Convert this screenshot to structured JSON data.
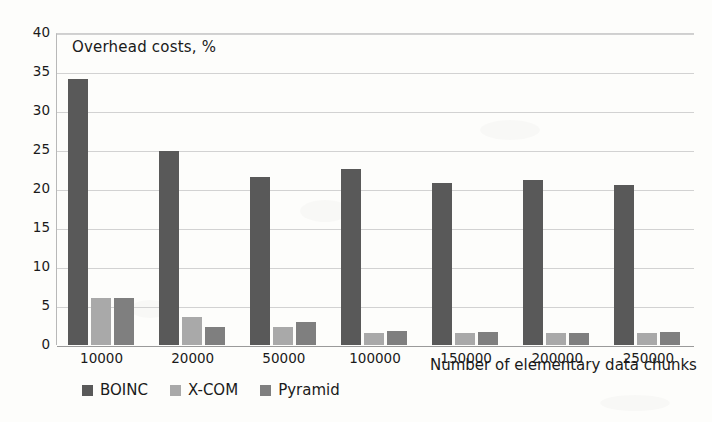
{
  "chart_data": {
    "type": "bar",
    "title": "Overhead costs, %",
    "xlabel": "Number of elementary data chunks",
    "ylabel": "",
    "ylim": [
      0,
      40
    ],
    "ytick_step": 5,
    "yticks": [
      "0",
      "5",
      "10",
      "15",
      "20",
      "25",
      "30",
      "35",
      "40"
    ],
    "grid": true,
    "legend_position": "bottom",
    "categories": [
      "10000",
      "20000",
      "50000",
      "100000",
      "150000",
      "200000",
      "250000"
    ],
    "series": [
      {
        "name": "BOINC",
        "color": "#595959",
        "values": [
          34.1,
          24.9,
          21.5,
          22.6,
          20.8,
          21.1,
          20.5
        ]
      },
      {
        "name": "X-COM",
        "color": "#a9a9a9",
        "values": [
          6.0,
          3.6,
          2.3,
          1.6,
          1.6,
          1.6,
          1.6
        ]
      },
      {
        "name": "Pyramid",
        "color": "#7f7f7f",
        "values": [
          6.0,
          2.3,
          3.0,
          1.8,
          1.7,
          1.6,
          1.7
        ]
      }
    ]
  }
}
